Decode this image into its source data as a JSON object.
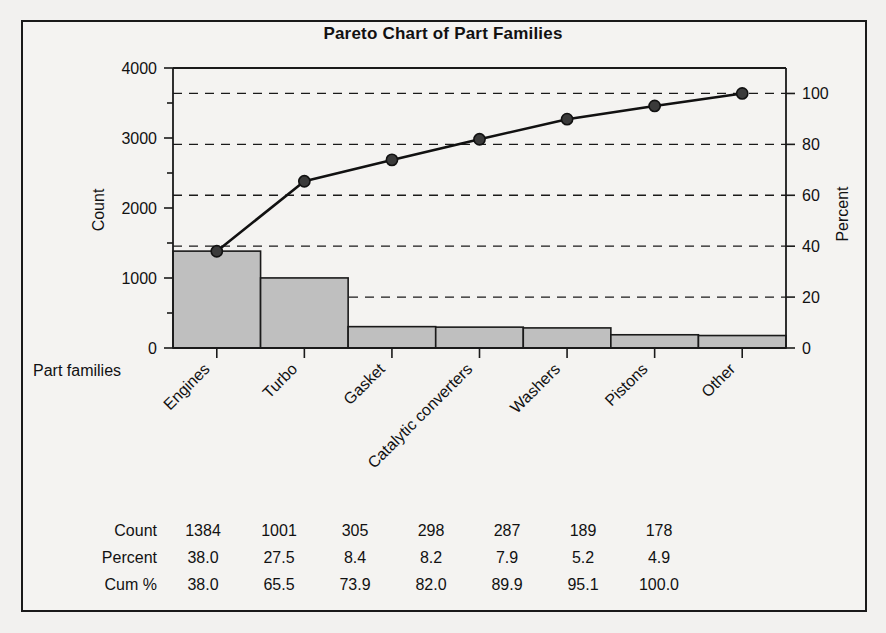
{
  "chart_data": {
    "type": "bar",
    "title": "Pareto Chart of Part Families",
    "xlabel": "Part families",
    "ylabel": "Count",
    "y2label": "Percent",
    "categories": [
      "Engines",
      "Turbo",
      "Gasket",
      "Catalytic converters",
      "Washers",
      "Pistons",
      "Other"
    ],
    "values": [
      1384,
      1001,
      305,
      298,
      287,
      189,
      178
    ],
    "series": [
      {
        "name": "Count",
        "values": [
          1384,
          1001,
          305,
          298,
          287,
          189,
          178
        ]
      },
      {
        "name": "Cum %",
        "values": [
          38.0,
          65.5,
          73.9,
          82.0,
          89.9,
          95.1,
          100.0
        ]
      }
    ],
    "percent": [
      38.0,
      27.5,
      8.4,
      8.2,
      7.9,
      5.2,
      4.9
    ],
    "cum_percent": [
      38.0,
      65.5,
      73.9,
      82.0,
      89.9,
      95.1,
      100.0
    ],
    "ylim": [
      0,
      4000
    ],
    "y2lim": [
      0,
      110
    ],
    "yticks": [
      "0",
      "1000",
      "2000",
      "3000",
      "4000"
    ],
    "ytick_values": [
      0,
      1000,
      2000,
      3000,
      4000
    ],
    "y2ticks": [
      "0",
      "20",
      "40",
      "60",
      "80",
      "100"
    ],
    "y2tick_values": [
      0,
      20,
      40,
      60,
      80,
      100
    ],
    "grid": true,
    "grid_axis": "percent",
    "legend": "none",
    "total_count": 3642,
    "colors": {
      "bar_fill": "#bfbfbf",
      "bar_stroke": "#1a1a1a",
      "line": "#111111",
      "marker": "#3a3a3a",
      "background": "#f4f3f1",
      "text": "#111111"
    }
  },
  "table": {
    "row_labels": [
      "Count",
      "Percent",
      "Cum %"
    ],
    "rows": [
      {
        "label": "Count",
        "cells": [
          "1384",
          "1001",
          "305",
          "298",
          "287",
          "189",
          "178"
        ]
      },
      {
        "label": "Percent",
        "cells": [
          "38.0",
          "27.5",
          "8.4",
          "8.2",
          "7.9",
          "5.2",
          "4.9"
        ]
      },
      {
        "label": "Cum %",
        "cells": [
          "38.0",
          "65.5",
          "73.9",
          "82.0",
          "89.9",
          "95.1",
          "100.0"
        ]
      }
    ]
  }
}
